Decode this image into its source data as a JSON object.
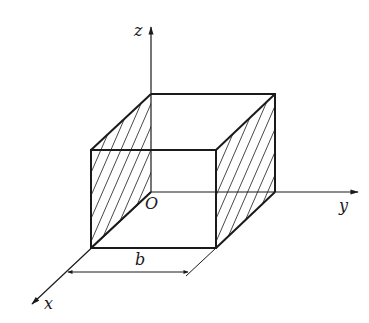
{
  "diagram": {
    "type": "3d-box-with-axes",
    "axes": {
      "x": "x",
      "y": "y",
      "z": "z",
      "origin": "O"
    },
    "dimension_label": "b",
    "hatched_faces": [
      "left face (x=0 plane side)",
      "right face"
    ],
    "colors": {
      "stroke": "#1a1a1a",
      "background": "#ffffff"
    }
  }
}
